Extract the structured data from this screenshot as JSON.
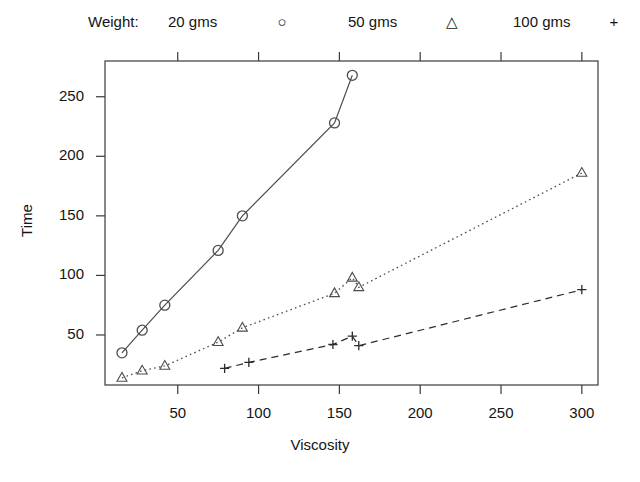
{
  "legend": {
    "title": "Weight:",
    "entries": [
      {
        "label": "20 gms",
        "symbol": "○"
      },
      {
        "label": "50 gms",
        "symbol": "△"
      },
      {
        "label": "100 gms",
        "symbol": "+"
      }
    ]
  },
  "axes": {
    "xlabel": "Viscosity",
    "ylabel": "Time",
    "xticks": [
      "50",
      "100",
      "150",
      "200",
      "250",
      "300"
    ],
    "yticks": [
      "50",
      "100",
      "150",
      "200",
      "250"
    ]
  },
  "chart_data": {
    "type": "line",
    "title": "",
    "xlabel": "Viscosity",
    "ylabel": "Time",
    "xlim": [
      5,
      310
    ],
    "ylim": [
      8,
      280
    ],
    "xticks": [
      50,
      100,
      150,
      200,
      250,
      300
    ],
    "yticks": [
      50,
      100,
      150,
      200,
      250
    ],
    "grid": false,
    "legend_position": "top",
    "legend_title": "Weight:",
    "series": [
      {
        "name": "20 gms",
        "marker": "circle",
        "linestyle": "solid",
        "color": "#4d4d4d",
        "points": [
          {
            "x": 15.5,
            "y": 35
          },
          {
            "x": 28,
            "y": 54
          },
          {
            "x": 42,
            "y": 75
          },
          {
            "x": 75,
            "y": 121
          },
          {
            "x": 90,
            "y": 150
          },
          {
            "x": 147,
            "y": 228
          },
          {
            "x": 158,
            "y": 268
          }
        ]
      },
      {
        "name": "50 gms",
        "marker": "triangle",
        "linestyle": "dotted",
        "color": "#4d4d4d",
        "points": [
          {
            "x": 15.5,
            "y": 14
          },
          {
            "x": 28,
            "y": 20
          },
          {
            "x": 42,
            "y": 24
          },
          {
            "x": 75,
            "y": 44
          },
          {
            "x": 90,
            "y": 56
          },
          {
            "x": 147,
            "y": 85
          },
          {
            "x": 158,
            "y": 98
          },
          {
            "x": 162,
            "y": 90
          },
          {
            "x": 300,
            "y": 186
          }
        ]
      },
      {
        "name": "100 gms",
        "marker": "plus",
        "linestyle": "dashed",
        "color": "#2b2b2b",
        "points": [
          {
            "x": 79,
            "y": 22
          },
          {
            "x": 94,
            "y": 27
          },
          {
            "x": 146,
            "y": 42
          },
          {
            "x": 158,
            "y": 49
          },
          {
            "x": 162,
            "y": 41
          },
          {
            "x": 300,
            "y": 88
          }
        ]
      }
    ]
  }
}
